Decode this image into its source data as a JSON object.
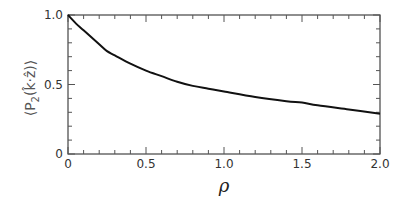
{
  "chart_data": {
    "type": "line",
    "title": "",
    "xlabel": "ρ",
    "ylabel": "⟨P₂(k̂·ẑ)⟩",
    "xlim": [
      0,
      2.0
    ],
    "ylim": [
      0,
      1.0
    ],
    "grid": false,
    "legend": null,
    "x_ticks": [
      "0",
      "0.5",
      "1.0",
      "1.5",
      "2.0"
    ],
    "y_ticks": [
      "0",
      "0.5",
      "1.0"
    ],
    "x_minor_tick_step": 0.1,
    "y_minor_tick_step": 0.1,
    "series": [
      {
        "name": "P2",
        "color": "#111111",
        "x": [
          0.0,
          0.05,
          0.1,
          0.2,
          0.25,
          0.3,
          0.4,
          0.5,
          0.6,
          0.7,
          0.8,
          0.9,
          1.0,
          1.2,
          1.4,
          1.5,
          1.6,
          1.8,
          2.0
        ],
        "y": [
          1.0,
          0.94,
          0.89,
          0.79,
          0.74,
          0.71,
          0.65,
          0.6,
          0.56,
          0.52,
          0.49,
          0.47,
          0.45,
          0.41,
          0.38,
          0.37,
          0.35,
          0.32,
          0.29
        ]
      }
    ]
  },
  "labels": {
    "xlabel": "ρ",
    "ylabel_P": "P",
    "ylabel_sub": "2",
    "ylabel_inner": "(k̂·ẑ)",
    "ylabel_left_bracket": "⟨",
    "ylabel_right_bracket": "⟩"
  }
}
